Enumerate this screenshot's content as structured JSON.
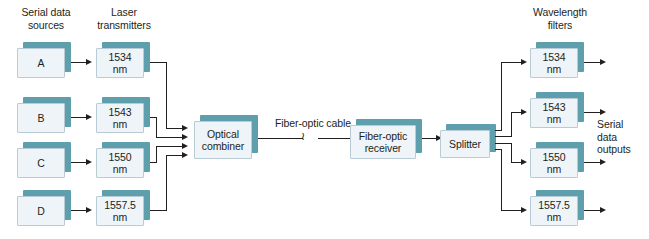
{
  "diagram": {
    "colors": {
      "box_face": "#eef4f8",
      "box_shadow": "#5e9fae",
      "line": "#231f20",
      "background": "#ffffff"
    }
  },
  "headings": {
    "sources": "Serial data\nsources",
    "transmitters": "Laser\ntransmitters",
    "filters": "Wavelength\nfilters"
  },
  "labels": {
    "fiber_cable": "Fiber-optic cable",
    "break_symbol": "≀",
    "outputs": "Serial\ndata\noutputs"
  },
  "sources": [
    {
      "id": "A",
      "label": "A"
    },
    {
      "id": "B",
      "label": "B"
    },
    {
      "id": "C",
      "label": "C"
    },
    {
      "id": "D",
      "label": "D"
    }
  ],
  "transmitters": [
    {
      "id": "tx-1534",
      "label": "1534\nnm"
    },
    {
      "id": "tx-1543",
      "label": "1543\nnm"
    },
    {
      "id": "tx-1550",
      "label": "1550\nnm"
    },
    {
      "id": "tx-1557-5",
      "label": "1557.5\nnm"
    }
  ],
  "filters": [
    {
      "id": "filt-1534",
      "label": "1534\nnm"
    },
    {
      "id": "filt-1543",
      "label": "1543\nnm"
    },
    {
      "id": "filt-1550",
      "label": "1550\nnm"
    },
    {
      "id": "filt-1557-5",
      "label": "1557.5\nnm"
    }
  ],
  "stages": {
    "combiner": "Optical\ncombiner",
    "receiver": "Fiber-optic\nreceiver",
    "splitter": "Splitter"
  }
}
